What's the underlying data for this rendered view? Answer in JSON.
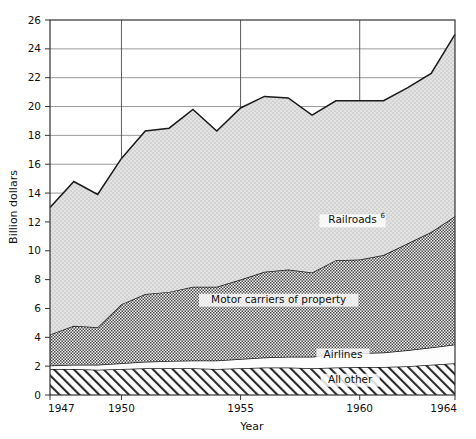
{
  "chart_data": {
    "type": "area",
    "stacked": true,
    "title": "",
    "xlabel": "Year",
    "ylabel": "Billion dollars",
    "xlim": [
      1947,
      1964
    ],
    "ylim": [
      0,
      26
    ],
    "ytick_step": 2,
    "yticks": [
      0,
      2,
      4,
      6,
      8,
      10,
      12,
      14,
      16,
      18,
      20,
      22,
      24,
      26
    ],
    "xticks": [
      1947,
      1950,
      1955,
      1960,
      1964
    ],
    "xtick_labels": [
      "1947",
      "1950",
      "1955",
      "1960",
      "1964"
    ],
    "grid": "both",
    "legend_position": "inline-labels",
    "x": [
      1947,
      1948,
      1949,
      1950,
      1951,
      1952,
      1953,
      1954,
      1955,
      1956,
      1957,
      1958,
      1959,
      1960,
      1961,
      1962,
      1963,
      1964
    ],
    "series": [
      {
        "name": "All other",
        "label": "All other",
        "fill": "diagonal-hatch",
        "values": [
          1.8,
          1.8,
          1.75,
          1.8,
          1.85,
          1.85,
          1.85,
          1.8,
          1.85,
          1.9,
          1.9,
          1.85,
          1.9,
          1.95,
          1.95,
          2.0,
          2.1,
          2.2
        ]
      },
      {
        "name": "Airlines",
        "label": "Airlines",
        "fill": "white",
        "values": [
          0.25,
          0.3,
          0.35,
          0.4,
          0.45,
          0.5,
          0.55,
          0.6,
          0.65,
          0.7,
          0.75,
          0.8,
          0.9,
          0.95,
          1.0,
          1.1,
          1.2,
          1.3
        ]
      },
      {
        "name": "Motor carriers of property",
        "label": "Motor carriers of property",
        "fill": "dense-dot",
        "values": [
          2.15,
          2.7,
          2.6,
          4.1,
          4.7,
          4.8,
          5.1,
          5.1,
          5.5,
          5.95,
          6.05,
          5.85,
          6.55,
          6.5,
          6.75,
          7.4,
          8.0,
          8.9
        ]
      },
      {
        "name": "Railroads",
        "label": "Railroads",
        "footnote": "6",
        "fill": "light-stipple",
        "values": [
          8.8,
          10.0,
          9.2,
          10.1,
          11.3,
          11.35,
          12.3,
          10.8,
          11.9,
          12.15,
          11.9,
          10.9,
          11.05,
          11.0,
          10.7,
          10.8,
          11.0,
          12.6
        ]
      }
    ],
    "totals": [
      13.0,
      14.8,
      13.9,
      16.4,
      18.3,
      18.5,
      19.8,
      18.3,
      19.9,
      20.7,
      20.6,
      19.4,
      20.4,
      20.4,
      20.4,
      21.3,
      22.3,
      25.0
    ],
    "series_label_positions": [
      {
        "name": "Railroads",
        "x": 1959.7,
        "y": 11.9
      },
      {
        "name": "Motor carriers of property",
        "x": 1956.6,
        "y": 6.4
      },
      {
        "name": "Airlines",
        "x": 1959.3,
        "y": 2.6
      },
      {
        "name": "All other",
        "x": 1959.6,
        "y": 0.85
      }
    ]
  },
  "axes": {
    "y_title": "Billion dollars",
    "x_title": "Year"
  }
}
